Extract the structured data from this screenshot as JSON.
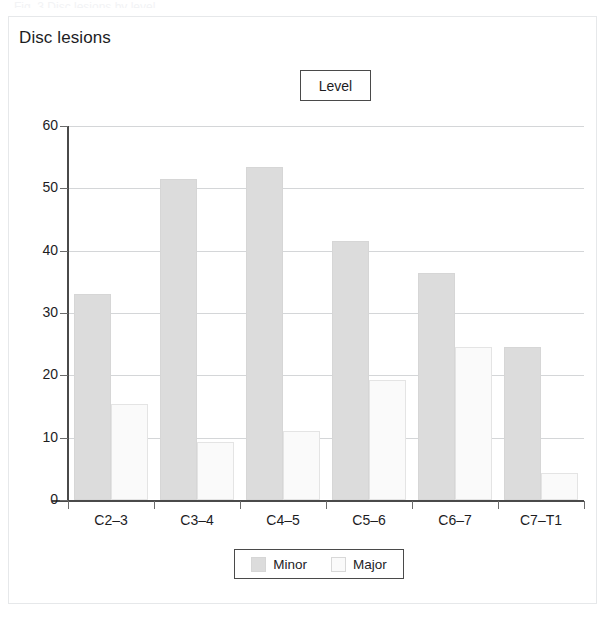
{
  "card": {
    "title": "Disc lesions",
    "top_sliver_text": "Fig. 3  Disc lesions by level"
  },
  "legend_title": {
    "label": "Level"
  },
  "legend": {
    "items": [
      {
        "label": "Minor",
        "color": "#dcdcdc",
        "swatch": "minor"
      },
      {
        "label": "Major",
        "color": "#fafafa",
        "swatch": "major"
      }
    ]
  },
  "chart_data": {
    "type": "bar",
    "title": "Disc lesions",
    "xlabel": "",
    "ylabel": "",
    "ylim": [
      0,
      60
    ],
    "yticks": [
      0,
      10,
      20,
      30,
      40,
      50,
      60
    ],
    "grid": true,
    "legend_position": "bottom",
    "legend_title": "Level",
    "categories": [
      "C2–3",
      "C3–4",
      "C4–5",
      "C5–6",
      "C6–7",
      "C7–T1"
    ],
    "series": [
      {
        "name": "Minor",
        "color": "#dcdcdc",
        "values": [
          33.0,
          51.5,
          53.4,
          41.5,
          36.4,
          24.6
        ]
      },
      {
        "name": "Major",
        "color": "#fafafa",
        "values": [
          15.4,
          9.3,
          11.1,
          19.3,
          24.5,
          4.4
        ]
      }
    ]
  },
  "axes": {
    "y_tick_labels": [
      "60",
      "50",
      "40",
      "30",
      "20",
      "10",
      "0"
    ],
    "x_tick_labels": [
      "C2–3",
      "C3–4",
      "C4–5",
      "C5–6",
      "C6–7",
      "C7–T1"
    ]
  }
}
